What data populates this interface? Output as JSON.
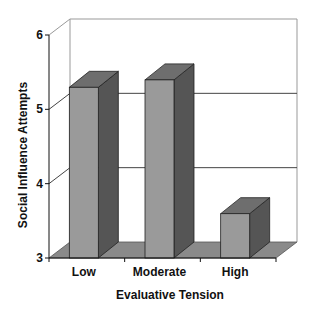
{
  "chart_data": {
    "type": "bar",
    "style": "3d-column",
    "title": "",
    "xlabel": "Evaluative Tension",
    "ylabel": "Social Influence Attempts",
    "categories": [
      "Low",
      "Moderate",
      "High"
    ],
    "values": [
      5.35,
      5.45,
      3.65
    ],
    "ylim": [
      3,
      6
    ],
    "yticks": [
      "3",
      "4",
      "5",
      "6"
    ],
    "grid": true,
    "legend": "none"
  },
  "colors": {
    "bar_front": "#9a9a9a",
    "bar_top": "#6e6e6e",
    "bar_side": "#555555",
    "floor": "#8a8a8a",
    "gridline": "#444444",
    "wall_edge": "#999999"
  }
}
